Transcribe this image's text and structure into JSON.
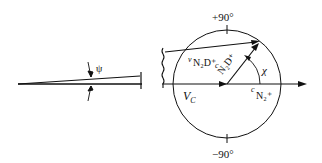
{
  "labels": {
    "psi": "ψ",
    "plus90": "+90°",
    "minus90": "−90°",
    "vc": "V",
    "vc_sub": "C",
    "v_prefix": "v",
    "v_main": "N₂D⁺",
    "c_prefix": "c",
    "c_main": "N₂D⁺",
    "c2_prefix": "c",
    "c2_main": "N₂⁺",
    "chi": "χ"
  },
  "colors": {
    "stroke": "#111111",
    "background": "#ffffff"
  }
}
